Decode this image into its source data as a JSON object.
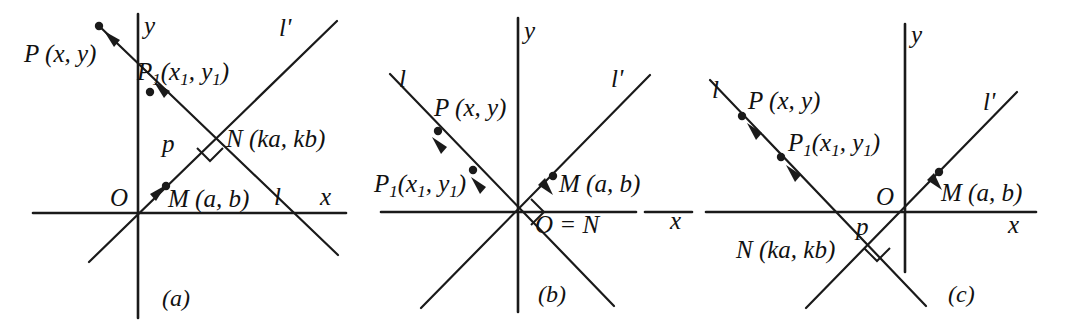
{
  "figure": {
    "background_color": "#ffffff",
    "ink_color": "#1a1a1a",
    "width": 1072,
    "height": 332
  },
  "panels": {
    "a": {
      "caption": "(a)",
      "axis_x_label": "x",
      "axis_y_label": "y",
      "origin_label": "O",
      "line_l_label": "l",
      "line_lprime_label": "l'",
      "point_P": "P (x, y)",
      "point_P1_main": "P",
      "point_P1_sub": "1",
      "point_P1_coords_open": "(x",
      "point_P1_coords_sub1": "1",
      "point_P1_coords_mid": ", y",
      "point_P1_coords_sub2": "1",
      "point_P1_coords_close": ")",
      "point_M": "M (a, b)",
      "point_N": "N (ka, kb)",
      "foot_p": "p",
      "right_angle_marked": true
    },
    "b": {
      "caption": "(b)",
      "axis_x_label": "x",
      "axis_y_label": "y",
      "line_l_label": "l",
      "line_lprime_label": "l'",
      "point_P": "P (x, y)",
      "point_P1_main": "P",
      "point_P1_sub": "1",
      "point_P1_coords_open": "(x",
      "point_P1_coords_sub1": "1",
      "point_P1_coords_mid": ", y",
      "point_P1_coords_sub2": "1",
      "point_P1_coords_close": ")",
      "point_M": "M (a, b)",
      "origin_equals_N": "O = N",
      "right_angle_marked": true
    },
    "c": {
      "caption": "(c)",
      "axis_x_label": "x",
      "axis_y_label": "y",
      "origin_label": "O",
      "line_l_label": "l",
      "line_lprime_label": "l'",
      "point_P": "P (x, y)",
      "point_P1_main": "P",
      "point_P1_sub": "1",
      "point_P1_coords_open": "(x",
      "point_P1_coords_sub1": "1",
      "point_P1_coords_mid": ", y",
      "point_P1_coords_sub2": "1",
      "point_P1_coords_close": ")",
      "point_M": "M (a, b)",
      "point_N": "N (ka, kb)",
      "foot_p": "p",
      "right_angle_marked": true
    }
  }
}
